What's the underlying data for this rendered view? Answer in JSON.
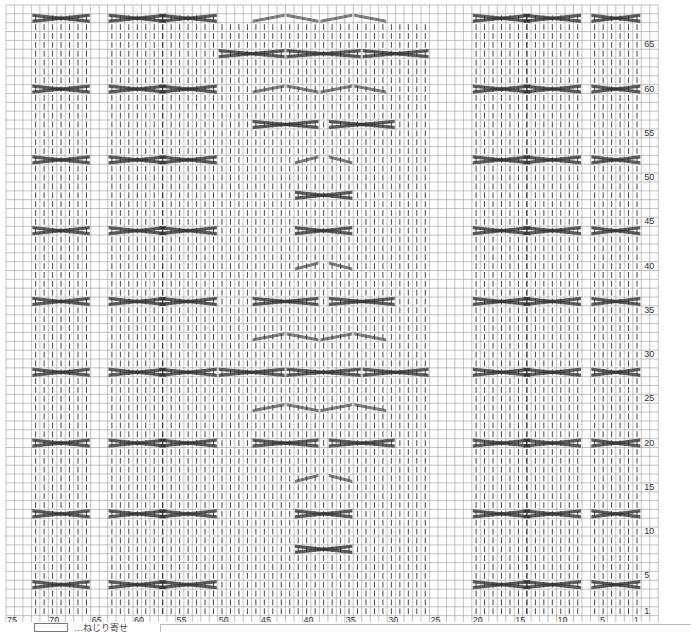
{
  "chart": {
    "columns": 75,
    "rows": 68,
    "grid_color": "#9a9a9a",
    "ink_color": "#333333",
    "column_labels": [
      "75",
      "70",
      "65",
      "60",
      "55",
      "50",
      "45",
      "40",
      "35",
      "30",
      "25",
      "20",
      "15",
      "10",
      "5",
      "1"
    ],
    "column_label_positions": [
      75,
      70,
      65,
      60,
      55,
      50,
      45,
      40,
      35,
      30,
      25,
      20,
      15,
      10,
      5,
      1
    ],
    "row_labels": [
      "65",
      "60",
      "55",
      "50",
      "45",
      "40",
      "35",
      "30",
      "25",
      "20",
      "15",
      "10",
      "5",
      "1"
    ],
    "row_label_positions": [
      65,
      60,
      55,
      50,
      45,
      40,
      35,
      30,
      25,
      20,
      15,
      10,
      5,
      1
    ]
  },
  "legend": {
    "symbol": "cable-cross-symbol",
    "text": "…ねじり寄せ"
  }
}
